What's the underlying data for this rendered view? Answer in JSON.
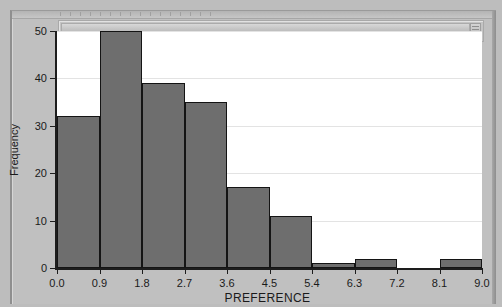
{
  "window": {
    "frame_color": "#c0c0c0",
    "scroll_pane_present": true
  },
  "chart_data": {
    "type": "bar",
    "title": "",
    "subtitle": "",
    "xlabel": "PREFERENCE",
    "ylabel": "Frequency",
    "xlim": [
      0.0,
      9.0
    ],
    "ylim": [
      0,
      50
    ],
    "grid": true,
    "legend": null,
    "bin_width": 0.9,
    "bin_edges": [
      0.0,
      0.9,
      1.8,
      2.7,
      3.6,
      4.5,
      5.4,
      6.3,
      7.2,
      8.1,
      9.0
    ],
    "categories": [
      "0.0-0.9",
      "0.9-1.8",
      "1.8-2.7",
      "2.7-3.6",
      "3.6-4.5",
      "4.5-5.4",
      "5.4-6.3",
      "6.3-7.2",
      "7.2-8.1",
      "8.1-9.0"
    ],
    "values": [
      32,
      50,
      39,
      35,
      17,
      11,
      1,
      2,
      0,
      2
    ],
    "x_ticks": [
      "0.0",
      "0.9",
      "1.8",
      "2.7",
      "3.6",
      "4.5",
      "5.4",
      "6.3",
      "7.2",
      "8.1",
      "9.0"
    ],
    "y_ticks": [
      "0",
      "10",
      "20",
      "30",
      "40",
      "50"
    ],
    "bar_color": "#6e6e6e",
    "bar_edge_color": "#141414",
    "plot_background": "#ffffff",
    "gridline_color": "#e3e3e3"
  }
}
